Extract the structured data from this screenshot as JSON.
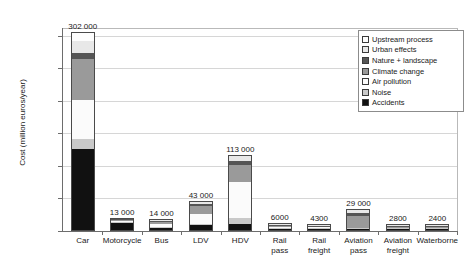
{
  "chart_data": {
    "type": "bar",
    "stacked": true,
    "title": "",
    "xlabel": "",
    "ylabel": "Cost (million euros/year)",
    "ylim": [
      0,
      310000
    ],
    "yticks": [
      0,
      50000,
      100000,
      150000,
      200000,
      250000,
      300000
    ],
    "ytick_labels": [
      "0",
      "50 000",
      "100 000",
      "150 000",
      "200 000",
      "250 000",
      "300 000"
    ],
    "grid": true,
    "legend_position": "top-right",
    "categories": [
      "Car",
      "Motorcycle",
      "Bus",
      "LDV",
      "HDV",
      "Rail\npass",
      "Rail\nfreight",
      "Aviation\npass",
      "Aviation\nfreight",
      "Waterborne"
    ],
    "totals": [
      302000,
      13000,
      14000,
      43000,
      113000,
      6000,
      4300,
      29000,
      2800,
      2400
    ],
    "total_labels": [
      "302 000",
      "13 000",
      "14 000",
      "43 000",
      "113 000",
      "6000",
      "4300",
      "29 000",
      "2800",
      "2400"
    ],
    "series": [
      {
        "name": "Accidents",
        "color": "#111111",
        "values": [
          124000,
          11500,
          3000,
          7500,
          9000,
          300,
          200,
          300,
          100,
          100
        ]
      },
      {
        "name": "Noise",
        "color": "#c9c9c9",
        "values": [
          16000,
          1000,
          1500,
          2500,
          9000,
          2400,
          1500,
          1000,
          200,
          100
        ]
      },
      {
        "name": "Air pollution",
        "color": "#fbfbfb",
        "values": [
          60000,
          300,
          5000,
          15000,
          56000,
          700,
          900,
          1400,
          400,
          1200
        ]
      },
      {
        "name": "Climate change",
        "color": "#9a9a9a",
        "values": [
          62000,
          100,
          3500,
          12000,
          26000,
          1500,
          1000,
          18000,
          1600,
          800
        ]
      },
      {
        "name": "Nature + landscape",
        "color": "#555555",
        "values": [
          10000,
          50,
          500,
          2500,
          6000,
          700,
          500,
          5000,
          300,
          100
        ]
      },
      {
        "name": "Urban effects",
        "color": "#e8e8e8",
        "values": [
          18000,
          50,
          500,
          3500,
          7000,
          400,
          200,
          3300,
          200,
          100
        ]
      },
      {
        "name": "Upstream process",
        "color": "#fdfdfd",
        "values": [
          12000,
          0,
          0,
          0,
          0,
          0,
          0,
          0,
          0,
          0
        ]
      }
    ]
  },
  "legend": {
    "items": [
      {
        "label": "Upstream process",
        "color": "#fdfdfd"
      },
      {
        "label": "Urban effects",
        "color": "#e8e8e8"
      },
      {
        "label": "Nature + landscape",
        "color": "#555555"
      },
      {
        "label": "Climate change",
        "color": "#9a9a9a"
      },
      {
        "label": "Air pollution",
        "color": "#fbfbfb"
      },
      {
        "label": "Noise",
        "color": "#c9c9c9"
      },
      {
        "label": "Accidents",
        "color": "#111111"
      }
    ]
  }
}
